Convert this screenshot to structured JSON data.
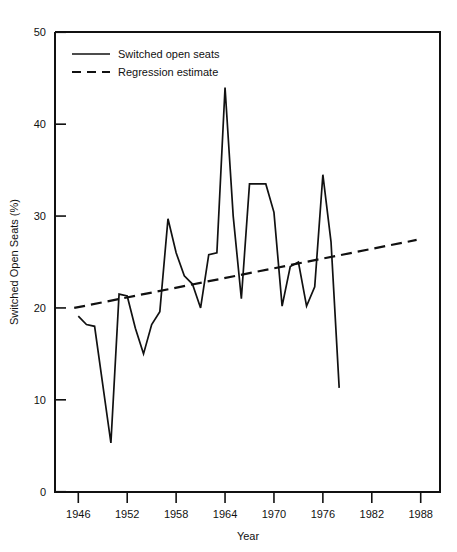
{
  "chart_data": {
    "type": "line",
    "title": "",
    "xlabel": "Year",
    "ylabel": "Switched Open Seats (%)",
    "xlim": [
      1944,
      1990
    ],
    "ylim": [
      0,
      50
    ],
    "grid": false,
    "legend_position": "top-left",
    "x_ticks": [
      1946,
      1952,
      1958,
      1964,
      1970,
      1976,
      1982,
      1988
    ],
    "x_tick_labels": [
      "1946",
      "1952",
      "1958",
      "1964",
      "1970",
      "1976",
      "1982",
      "1988"
    ],
    "y_ticks": [
      0,
      10,
      20,
      30,
      40,
      50
    ],
    "y_tick_labels": [
      "0",
      "10",
      "20",
      "30",
      "40",
      "50"
    ],
    "series": [
      {
        "name": "Switched open seats",
        "style": "solid",
        "color": "#111111",
        "x": [
          1946,
          1947,
          1948,
          1950,
          1951,
          1952,
          1953,
          1954,
          1955,
          1956,
          1957,
          1958,
          1959,
          1960,
          1961,
          1962,
          1963,
          1964,
          1965,
          1966,
          1967,
          1968,
          1969,
          1970,
          1971,
          1972,
          1973,
          1974,
          1975,
          1976,
          1977,
          1978
        ],
        "values": [
          19.1,
          18.2,
          18.0,
          5.3,
          21.5,
          21.3,
          17.8,
          15.0,
          18.2,
          19.6,
          29.7,
          26.0,
          23.5,
          22.6,
          20.0,
          25.8,
          26.0,
          44.0,
          30.0,
          21.0,
          33.5,
          33.5,
          33.5,
          30.4,
          20.2,
          24.5,
          25.0,
          20.2,
          22.3,
          34.5,
          27.2,
          11.3
        ]
      },
      {
        "name": "Regression estimate",
        "style": "dashed",
        "color": "#111111",
        "x": [
          1945.5,
          1987.5
        ],
        "values": [
          20.0,
          27.4
        ]
      }
    ],
    "legend": [
      {
        "label": "Switched open seats",
        "style": "solid"
      },
      {
        "label": "Regression estimate",
        "style": "dashed"
      }
    ]
  }
}
